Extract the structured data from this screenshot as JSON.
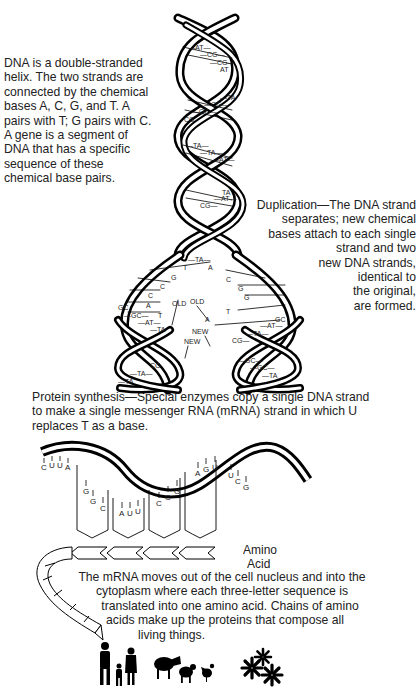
{
  "captions": {
    "intro": "DNA is a double-stranded helix. The two strands are connected by the chemical bases A, C, G, and T. A pairs with T; G pairs with C. A gene is a segment of DNA that has a specific sequence of these chemical base pairs.",
    "duplication_lines": [
      "Duplication—The DNA strand",
      "separates; new chemical",
      "bases attach to each single",
      "strand and two",
      "new DNA strands,",
      "identical to",
      "the original,",
      "are formed."
    ],
    "protein_synthesis": "Protein synthesis—Special enzymes copy a single DNA strand to make a single messenger RNA (mRNA) strand in which U replaces T as a base.",
    "mrna_lines": [
      "The mRNA moves out of the cell nucleus and into the",
      "cytoplasm where each three-letter sequence is",
      "translated into one amino acid. Chains of amino",
      "acids make up the proteins that compose all",
      "living things."
    ],
    "amino_label_lines": [
      "Amino",
      "Acid"
    ]
  },
  "helix": {
    "upper_base_pairs": [
      "AT",
      "CG",
      "CG",
      "AT",
      "TA",
      "CG",
      "GC",
      "CG",
      "TA",
      "TA",
      "AT",
      "TA",
      "AT",
      "CG"
    ],
    "split_pair": "TA",
    "left_single_bases": [
      "T",
      "G",
      "C",
      "C",
      "A",
      "T"
    ],
    "right_single_bases": [
      "A",
      "C",
      "G",
      "G",
      "T",
      "A"
    ],
    "strand_labels": {
      "old": "OLD",
      "new": "NEW"
    },
    "left_daughter_pairs": [
      "GC",
      "GC",
      "AT",
      "TA",
      "CG",
      "TA",
      "TA"
    ],
    "right_daughter_pairs": [
      "GC",
      "AT",
      "TA",
      "CG",
      "GC",
      "GC",
      "TA"
    ]
  },
  "mrna": {
    "codons": [
      {
        "bases": [
          "C",
          "U",
          "U",
          "A"
        ]
      },
      {
        "bases": [
          "G",
          "G",
          "C"
        ]
      },
      {
        "bases": [
          "A",
          "U",
          "U"
        ]
      },
      {
        "bases": [
          "C",
          "C",
          "G"
        ]
      },
      {
        "bases": [
          "A",
          "G",
          "U"
        ]
      },
      {
        "bases": [
          "U",
          "C",
          "G"
        ]
      }
    ]
  },
  "organisms": [
    "people-icon",
    "cow-icon",
    "sheep-icon",
    "chicken-icon",
    "flower-icon"
  ]
}
